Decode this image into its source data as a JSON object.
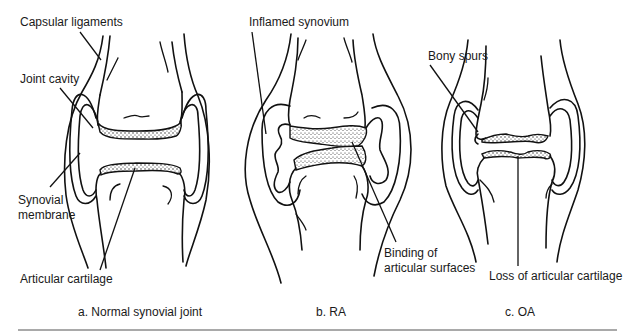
{
  "figure": {
    "panels": [
      {
        "id": "a",
        "caption": "a. Normal synovial joint",
        "labels": {
          "capsular_ligaments": "Capsular ligaments",
          "joint_cavity": "Joint cavity",
          "synovial_membrane_1": "Synovial",
          "synovial_membrane_2": "membrane",
          "articular_cartilage": "Articular cartilage"
        }
      },
      {
        "id": "b",
        "caption": "b. RA",
        "labels": {
          "inflamed_synovium": "Inflamed synovium",
          "binding_1": "Binding of",
          "binding_2": "articular surfaces"
        }
      },
      {
        "id": "c",
        "caption": "c. OA",
        "labels": {
          "bony_spurs": "Bony spurs",
          "loss_of_cartilage": "Loss of articular cartilage"
        }
      }
    ]
  }
}
